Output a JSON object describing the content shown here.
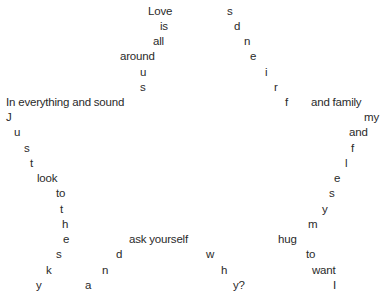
{
  "poem": {
    "words": [
      {
        "text": "Love",
        "x": 148,
        "y": 5
      },
      {
        "text": "is",
        "x": 160,
        "y": 20
      },
      {
        "text": "all",
        "x": 153,
        "y": 35
      },
      {
        "text": "around",
        "x": 120,
        "y": 50
      },
      {
        "text": "u",
        "x": 140,
        "y": 66
      },
      {
        "text": "s",
        "x": 140,
        "y": 81
      },
      {
        "text": "In everything and sound",
        "x": 6,
        "y": 96
      },
      {
        "text": "J",
        "x": 6,
        "y": 111
      },
      {
        "text": "u",
        "x": 14,
        "y": 126
      },
      {
        "text": "s",
        "x": 24,
        "y": 142
      },
      {
        "text": "t",
        "x": 30,
        "y": 157
      },
      {
        "text": "look",
        "x": 37,
        "y": 172
      },
      {
        "text": "to",
        "x": 56,
        "y": 187
      },
      {
        "text": "t",
        "x": 60,
        "y": 203
      },
      {
        "text": "h",
        "x": 62,
        "y": 218
      },
      {
        "text": "e",
        "x": 63,
        "y": 233
      },
      {
        "text": "s",
        "x": 56,
        "y": 248
      },
      {
        "text": "k",
        "x": 46,
        "y": 264
      },
      {
        "text": "y",
        "x": 36,
        "y": 279
      },
      {
        "text": "ask yourself",
        "x": 129,
        "y": 233
      },
      {
        "text": "d",
        "x": 116,
        "y": 248
      },
      {
        "text": "n",
        "x": 102,
        "y": 264
      },
      {
        "text": "a",
        "x": 85,
        "y": 279
      },
      {
        "text": "s",
        "x": 227,
        "y": 5
      },
      {
        "text": "d",
        "x": 234,
        "y": 20
      },
      {
        "text": "n",
        "x": 244,
        "y": 35
      },
      {
        "text": "e",
        "x": 250,
        "y": 50
      },
      {
        "text": "i",
        "x": 265,
        "y": 66
      },
      {
        "text": "r",
        "x": 274,
        "y": 81
      },
      {
        "text": "f",
        "x": 285,
        "y": 96
      },
      {
        "text": "and family",
        "x": 311,
        "y": 96
      },
      {
        "text": "my",
        "x": 364,
        "y": 111
      },
      {
        "text": "and",
        "x": 349,
        "y": 126
      },
      {
        "text": "f",
        "x": 351,
        "y": 142
      },
      {
        "text": "l",
        "x": 345,
        "y": 157
      },
      {
        "text": "e",
        "x": 334,
        "y": 172
      },
      {
        "text": "s",
        "x": 329,
        "y": 187
      },
      {
        "text": "y",
        "x": 322,
        "y": 203
      },
      {
        "text": "m",
        "x": 308,
        "y": 218
      },
      {
        "text": "hug",
        "x": 278,
        "y": 233
      },
      {
        "text": "to",
        "x": 306,
        "y": 248
      },
      {
        "text": "want",
        "x": 312,
        "y": 264
      },
      {
        "text": "I",
        "x": 333,
        "y": 279
      },
      {
        "text": "w",
        "x": 206,
        "y": 248
      },
      {
        "text": "h",
        "x": 221,
        "y": 264
      },
      {
        "text": "y?",
        "x": 233,
        "y": 279
      }
    ]
  }
}
